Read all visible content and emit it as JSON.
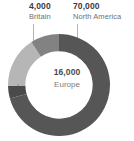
{
  "chart_data": {
    "type": "pie",
    "title": "",
    "subtitle": "",
    "xlabel": "",
    "ylabel": "",
    "legend_position": "callouts",
    "grid": false,
    "donut": true,
    "inner_radius_ratio": 0.66,
    "categories": [
      "North America",
      "Britain",
      "Europe",
      "Other"
    ],
    "values": [
      70000,
      4000,
      16000,
      9000
    ],
    "value_labels": [
      "70,000",
      "4,000",
      "16,000",
      ""
    ],
    "colors": [
      "#565656",
      "#4a4a4a",
      "#b6b6b6",
      "#828282"
    ],
    "annotations": [
      {
        "value": "4,000",
        "name": "Britain",
        "leader": true
      },
      {
        "value": "70,000",
        "name": "North America",
        "leader": true
      },
      {
        "value": "16,000",
        "name": "Europe",
        "leader": false
      }
    ]
  },
  "callouts": {
    "britain": {
      "value": "4,000",
      "name": "Britain"
    },
    "north_america": {
      "value": "70,000",
      "name": "North America"
    }
  },
  "center": {
    "value": "16,000",
    "name": "Europe"
  },
  "colors": {
    "north_america": "#565656",
    "britain": "#4a4a4a",
    "europe": "#b6b6b6",
    "other": "#828282",
    "background": "#ffffff",
    "leader_line": "#b4b4b4",
    "value_text": "#3b3b3b",
    "name_text": "#6f6f6f"
  }
}
